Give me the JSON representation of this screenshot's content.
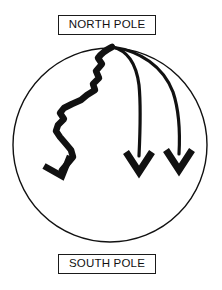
{
  "figure": {
    "title_top": "NORTH POLE",
    "title_bottom": "SOUTH POLE",
    "background_color": "#ffffff",
    "stroke_color": "#111111"
  },
  "labels": {
    "north": {
      "text": "NORTH POLE"
    },
    "south": {
      "text": "SOUTH POLE"
    }
  },
  "globe": {
    "name": "globe-circle",
    "center_x": 110,
    "center_y": 145,
    "radius": 97,
    "stroke_width": 1.4
  },
  "arrows": [
    {
      "name": "jagged-path-arrow",
      "style": "zigzag",
      "stroke_width": 6.5,
      "origin": "north-pole",
      "end_x": 58,
      "end_y": 178
    },
    {
      "name": "curved-arrow-middle",
      "style": "smooth-curve",
      "stroke_width": 3.2,
      "origin": "north-pole",
      "end_x": 139,
      "end_y": 170
    },
    {
      "name": "curved-arrow-right",
      "style": "smooth-curve",
      "stroke_width": 3.2,
      "origin": "north-pole",
      "end_x": 179,
      "end_y": 168
    }
  ]
}
